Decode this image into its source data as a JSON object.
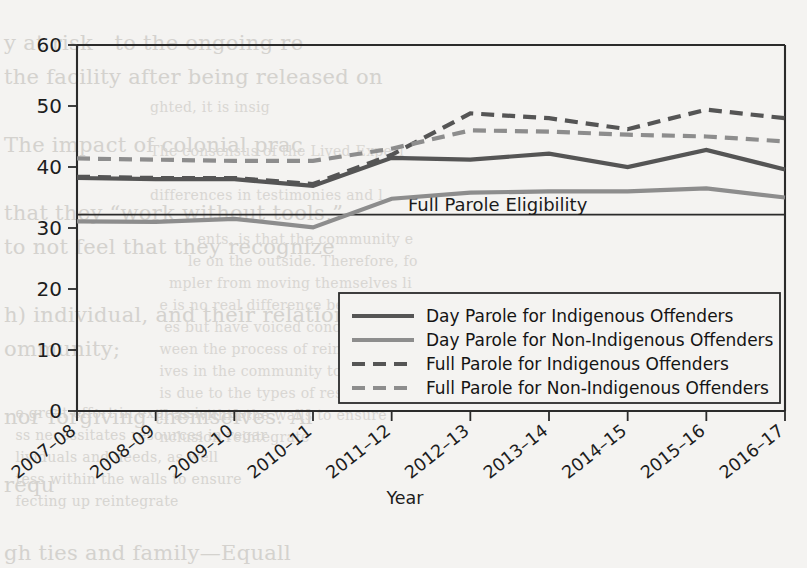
{
  "chart_data": {
    "type": "line",
    "title": "",
    "xlabel": "Year",
    "ylabel": "",
    "ylim": [
      0,
      60
    ],
    "yticks": [
      0,
      10,
      20,
      30,
      40,
      50,
      60
    ],
    "grid": false,
    "legend_position": "center-right",
    "categories": [
      "2007–08",
      "2008–09",
      "2009–10",
      "2010–11",
      "2011–12",
      "2012–13",
      "2013–14",
      "2014–15",
      "2015–16",
      "2016–17"
    ],
    "series": [
      {
        "name": "Day Parole for Indigenous Offenders",
        "style": "solid",
        "color": "#555555",
        "values": [
          38.2,
          38.0,
          38.0,
          36.9,
          41.5,
          41.2,
          42.2,
          40.0,
          42.8,
          39.6
        ]
      },
      {
        "name": "Day Parole for Non-Indigenous Offenders",
        "style": "solid",
        "color": "#8d8d8d",
        "values": [
          31.1,
          31.0,
          31.5,
          30.1,
          34.8,
          35.8,
          36.0,
          36.0,
          36.5,
          35.0
        ]
      },
      {
        "name": "Full Parole for Indigenous Offenders",
        "style": "dashed",
        "color": "#555555",
        "values": [
          38.4,
          38.2,
          38.2,
          37.2,
          42.0,
          48.8,
          48.0,
          46.2,
          49.4,
          48.0
        ]
      },
      {
        "name": "Full Parole for Non-Indigenous Offenders",
        "style": "dashed",
        "color": "#8d8d8d",
        "values": [
          41.4,
          41.2,
          41.0,
          41.0,
          43.0,
          46.0,
          45.8,
          45.3,
          45.0,
          44.2
        ]
      }
    ],
    "annotations": [
      {
        "name": "full-parole-eligibility",
        "label": "Full Parole Eligibility",
        "type": "hline",
        "value": 32.2
      }
    ]
  },
  "background_text": {
    "left": "y at risk—to the ongoing re\nthe facility after being released on\n\nThe impact of colonial prac\n\nthat they “work without tools,”\nto not feel that they recognize\n\nh) individual, and their relations\nommunity;\n\nnor forgiving themselves. Al\n\nrequ\n\ngh ties and family—Equall",
    "right": "\nss and\nsses\n\n",
    "mid": "ghted, it is insig\n\nThe consensus of the Lived Experi\n\ndifferences in testimonies and l\n\n          ents, is that the community e\n        le on the outside. Therefore, fo\n    mpler from moving themselves li\n  e is no real difference between t\n   es but have voiced concerns of\n  ween the process of reintegrati\n  ives in the community to integ\n  is due to the types of resources\n  ll as within the walls to ensure\n  nclusion reintegrate",
    "bottom": "  e great effort in expression repr\n  ss necessitates resources in regar\n  lividuals and needs, as well\n  tess within the walls to ensure\n  fecting up reintegrate"
  }
}
